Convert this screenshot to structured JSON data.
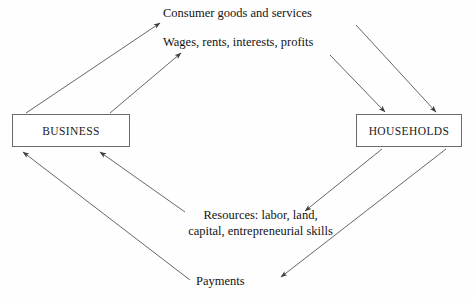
{
  "diagram": {
    "nodes": [
      {
        "id": "business",
        "label": "BUSINESS"
      },
      {
        "id": "households",
        "label": "HOUSEHOLDS"
      }
    ],
    "flow_labels": {
      "consumer_goods": "Consumer goods and services",
      "wages": "Wages, rents, interests, profits",
      "resources_line1": "Resources: labor, land,",
      "resources_line2": "capital, entrepreneurial skills",
      "payments": "Payments"
    },
    "colors": {
      "stroke": "#4a4a4a",
      "box_border": "#6b6b6b",
      "text": "#141414",
      "background": "#fefefe"
    }
  }
}
